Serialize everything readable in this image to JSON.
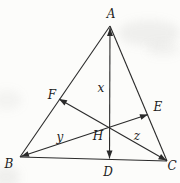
{
  "figure": {
    "canvas": {
      "width": 180,
      "height": 183
    },
    "colors": {
      "line": "#2a2a2a",
      "label": "#1c1c1c",
      "background": "#fcfcfa"
    },
    "points": [
      {
        "name": "A",
        "label": "A",
        "x": 110,
        "y": 26,
        "label_x": 111,
        "label_y": 18,
        "font_size": 12
      },
      {
        "name": "B",
        "label": "B",
        "x": 20,
        "y": 157,
        "label_x": 9,
        "label_y": 168,
        "font_size": 12
      },
      {
        "name": "C",
        "label": "C",
        "x": 167,
        "y": 161,
        "label_x": 172,
        "label_y": 170,
        "font_size": 12
      },
      {
        "name": "D",
        "label": "D",
        "x": 109.5,
        "y": 160.5,
        "label_x": 108,
        "label_y": 176,
        "font_size": 12
      },
      {
        "name": "E",
        "label": "E",
        "x": 148,
        "y": 114.5,
        "label_x": 158,
        "label_y": 111,
        "font_size": 12
      },
      {
        "name": "F",
        "label": "F",
        "x": 59,
        "y": 99,
        "label_x": 52,
        "label_y": 99,
        "font_size": 12
      },
      {
        "name": "H",
        "label": "H",
        "x": 110,
        "y": 127,
        "label_x": 98,
        "label_y": 140,
        "font_size": 12
      }
    ],
    "segments": [
      {
        "name": "side-AB",
        "from": [
          110,
          26
        ],
        "to": [
          20,
          157
        ],
        "arrow_start": false,
        "arrow_end": false
      },
      {
        "name": "side-AC",
        "from": [
          110,
          26
        ],
        "to": [
          167,
          161
        ],
        "arrow_start": false,
        "arrow_end": false
      },
      {
        "name": "side-BC",
        "from": [
          20,
          157
        ],
        "to": [
          167,
          161
        ],
        "arrow_start": false,
        "arrow_end": false
      },
      {
        "name": "cevian-DA",
        "from": [
          109.5,
          158.5
        ],
        "to": [
          110,
          28
        ],
        "arrow_start": true,
        "arrow_end": true
      },
      {
        "name": "cevian-CF",
        "from": [
          166.5,
          160.5
        ],
        "to": [
          59,
          99
        ],
        "arrow_start": true,
        "arrow_end": true
      },
      {
        "name": "cevian-BE",
        "from": [
          21,
          156.5
        ],
        "to": [
          148,
          114.5
        ],
        "arrow_start": true,
        "arrow_end": true
      }
    ],
    "measure_labels": [
      {
        "name": "x",
        "text": "x",
        "label_x": 101,
        "label_y": 92,
        "font_size": 12
      },
      {
        "name": "y",
        "text": "y",
        "label_x": 60,
        "label_y": 141,
        "font_size": 12
      },
      {
        "name": "z",
        "text": "z",
        "label_x": 137,
        "label_y": 140,
        "font_size": 12
      }
    ],
    "arrow": {
      "length": 8,
      "half_width": 3
    }
  }
}
